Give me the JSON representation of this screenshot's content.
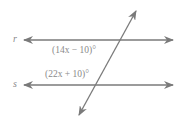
{
  "diagram": {
    "lines": [
      {
        "name": "r",
        "label": "r"
      },
      {
        "name": "s",
        "label": "s"
      }
    ],
    "angles": [
      {
        "label": "(14x − 10)°"
      },
      {
        "label": "(22x + 10)°"
      }
    ],
    "colors": {
      "stroke": "#7a7a7a",
      "text": "#8a8a8a"
    }
  }
}
